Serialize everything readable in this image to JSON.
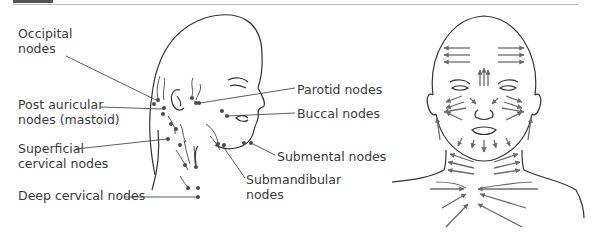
{
  "labels": {
    "occipital": [
      "Occipital",
      "nodes"
    ],
    "post_auricular": [
      "Post auricular",
      "nodes (mastoid)"
    ],
    "superficial_cervical": [
      "Superficial",
      "cervical nodes"
    ],
    "deep_cervical": "Deep cervical nodes",
    "parotid": "Parotid nodes",
    "buccal": "Buccal nodes",
    "submental": "Submental nodes",
    "submandibular": [
      "Submandibular",
      "nodes"
    ]
  },
  "colors": {
    "line": "#333333",
    "node": "#4a4a4a",
    "arrow": "#6b6b6b",
    "header_bar": "#555555",
    "rule": "#bdbdbd"
  }
}
